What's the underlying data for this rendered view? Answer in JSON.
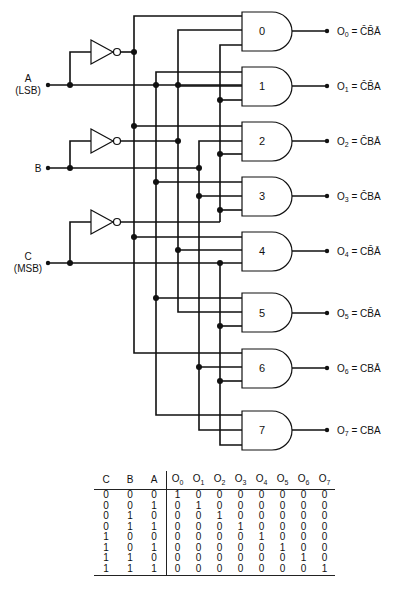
{
  "inputs": [
    {
      "name": "A",
      "sublabel": "(LSB)"
    },
    {
      "name": "B",
      "sublabel": ""
    },
    {
      "name": "C",
      "sublabel": "(MSB)"
    }
  ],
  "gates": [
    {
      "id": "0",
      "output": "O",
      "sub": "0",
      "expr": "C̄B̄Ā"
    },
    {
      "id": "1",
      "output": "O",
      "sub": "1",
      "expr": "C̄B̄A"
    },
    {
      "id": "2",
      "output": "O",
      "sub": "2",
      "expr": "C̄BĀ"
    },
    {
      "id": "3",
      "output": "O",
      "sub": "3",
      "expr": "C̄BA"
    },
    {
      "id": "4",
      "output": "O",
      "sub": "4",
      "expr": "CB̄Ā"
    },
    {
      "id": "5",
      "output": "O",
      "sub": "5",
      "expr": "CB̄A"
    },
    {
      "id": "6",
      "output": "O",
      "sub": "6",
      "expr": "CBĀ"
    },
    {
      "id": "7",
      "output": "O",
      "sub": "7",
      "expr": "CBA"
    }
  ],
  "truth_table": {
    "input_headers": [
      "C",
      "B",
      "A"
    ],
    "output_headers": [
      "0",
      "1",
      "2",
      "3",
      "4",
      "5",
      "6",
      "7"
    ],
    "output_prefix": "O",
    "rows": [
      [
        "0",
        "0",
        "0",
        "1",
        "0",
        "0",
        "0",
        "0",
        "0",
        "0",
        "0"
      ],
      [
        "0",
        "0",
        "1",
        "0",
        "1",
        "0",
        "0",
        "0",
        "0",
        "0",
        "0"
      ],
      [
        "0",
        "1",
        "0",
        "0",
        "0",
        "1",
        "0",
        "0",
        "0",
        "0",
        "0"
      ],
      [
        "0",
        "1",
        "1",
        "0",
        "0",
        "0",
        "1",
        "0",
        "0",
        "0",
        "0"
      ],
      [
        "1",
        "0",
        "0",
        "0",
        "0",
        "0",
        "0",
        "1",
        "0",
        "0",
        "0"
      ],
      [
        "1",
        "0",
        "1",
        "0",
        "0",
        "0",
        "0",
        "0",
        "1",
        "0",
        "0"
      ],
      [
        "1",
        "1",
        "0",
        "0",
        "0",
        "0",
        "0",
        "0",
        "0",
        "1",
        "0"
      ],
      [
        "1",
        "1",
        "1",
        "0",
        "0",
        "0",
        "0",
        "0",
        "0",
        "0",
        "1"
      ]
    ]
  }
}
